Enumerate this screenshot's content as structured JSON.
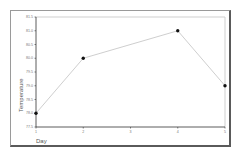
{
  "chart_data": {
    "type": "line",
    "title": "",
    "xlabel": "Day",
    "ylabel": "Temperature",
    "x": [
      1,
      2,
      4,
      5
    ],
    "series": [
      {
        "name": "Temperature",
        "values": [
          78.0,
          80.0,
          81.0,
          79.0
        ]
      }
    ],
    "xticks": [
      "1",
      "2",
      "3",
      "4",
      "5"
    ],
    "xtick_values": [
      1,
      2,
      3,
      4,
      5
    ],
    "yticks": [
      "77.5",
      "78.0",
      "78.5",
      "79.0",
      "79.5",
      "80.0",
      "80.5",
      "81.0",
      "81.5"
    ],
    "ytick_values": [
      77.5,
      78.0,
      78.5,
      79.0,
      79.5,
      80.0,
      80.5,
      81.0,
      81.5
    ],
    "xlim": [
      1,
      5
    ],
    "ylim": [
      77.5,
      81.5
    ],
    "grid": false,
    "legend": "none",
    "colors": {
      "line": "#c8c8c8",
      "marker": "#111111",
      "axis": "#333333",
      "plot_border": "#cfcfcf"
    }
  }
}
